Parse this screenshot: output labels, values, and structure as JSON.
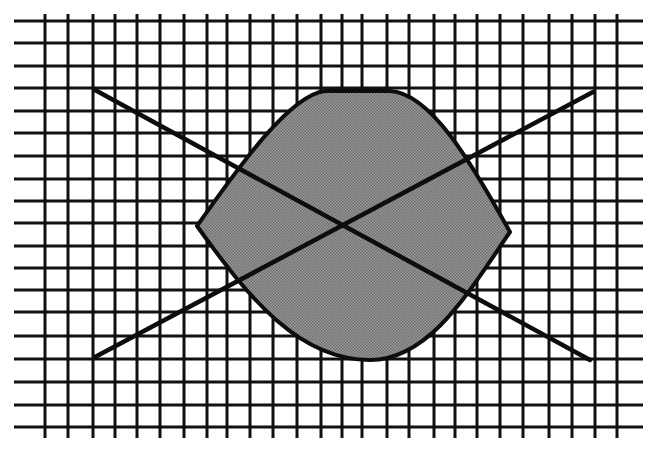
{
  "figure": {
    "colors": {
      "background": "#ffffff",
      "grid": "#111111",
      "lines": "#0d0d0d",
      "fill": "#8c8c8c"
    },
    "grid": {
      "vertical_x": [
        45,
        68,
        93,
        115,
        137,
        160,
        184,
        207,
        227,
        250,
        273,
        297,
        321,
        342,
        362,
        387,
        409,
        434,
        455,
        477,
        500,
        523,
        549,
        572,
        595,
        617
      ],
      "vertical_y_range": [
        14,
        438
      ],
      "horizontal_y": [
        21,
        43,
        66,
        88,
        111,
        133,
        156,
        179,
        201,
        223,
        246,
        268,
        290,
        312,
        336,
        359,
        382,
        405,
        427
      ],
      "horizontal_x_range": [
        14,
        643
      ]
    },
    "diagonals": [
      {
        "name": "descending",
        "x1": 95,
        "y1": 90,
        "x2": 590,
        "y2": 360
      },
      {
        "name": "ascending",
        "x1": 95,
        "y1": 357,
        "x2": 593,
        "y2": 92
      }
    ],
    "lens": {
      "left_point": [
        197,
        226
      ],
      "right_point": [
        510,
        232
      ],
      "top_point": [
        360,
        91
      ],
      "bottom_point": [
        362,
        360
      ]
    }
  }
}
